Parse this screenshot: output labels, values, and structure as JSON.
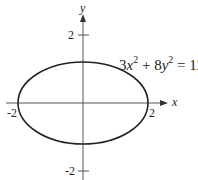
{
  "diagram": {
    "equation": {
      "coef_x": "3",
      "var_x": "x",
      "exp_x": "2",
      "plus": " + 8",
      "var_y": "y",
      "exp_y": "2",
      "rhs": " = 12"
    },
    "axes": {
      "x_label": "x",
      "y_label": "y",
      "x_ticks": [
        "-2",
        "2"
      ],
      "y_ticks": [
        "2",
        "-2"
      ]
    },
    "curve": {
      "type": "ellipse",
      "semi_major_x": 2,
      "semi_minor_y": 1.22,
      "stroke": "#222222"
    }
  }
}
